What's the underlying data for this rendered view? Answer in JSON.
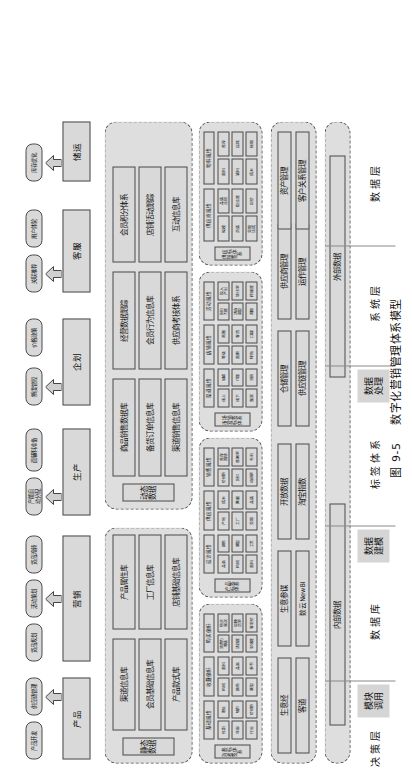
{
  "figure": {
    "caption_number": "图 9-5",
    "caption_title": "数字化营销管理体系模型"
  },
  "layers": [
    {
      "name": "决策层",
      "sub": "模块\n调用"
    },
    {
      "name": "数据库",
      "sub": "数据\n建模"
    },
    {
      "name": "标签体系",
      "sub": "数据\n处理"
    },
    {
      "name": "系统层",
      "sub": ""
    },
    {
      "name": "数据层",
      "sub": ""
    }
  ],
  "decision_layer": {
    "functions": [
      {
        "label": "产品",
        "chips": [
          "产品开发",
          "供应链管理"
        ]
      },
      {
        "label": "营销",
        "chips": [
          "货品规划",
          "活动策划",
          "货品流转"
        ]
      },
      {
        "label": "生产",
        "chips": [
          "产能自\n动分配",
          "面辅料准备"
        ]
      },
      {
        "label": "企划",
        "chips": [
          "额度管控",
          "价格政策"
        ]
      },
      {
        "label": "客服",
        "chips": [
          "关联推荐",
          "用户体验"
        ]
      },
      {
        "label": "储运",
        "chips": [
          "库存优化"
        ]
      }
    ]
  },
  "database_layer": {
    "groups": [
      {
        "title": "静态数据",
        "columns": [
          [
            "渠道信息库",
            "会员基础信息库",
            "产品款式库"
          ],
          [
            "产品属性库",
            "工厂信息库",
            "店铺基础信息库"
          ]
        ]
      },
      {
        "title": "动态数据",
        "columns": [
          [
            "商品销售数据库",
            "备货订单信息库",
            "渠道销售信息库"
          ],
          [
            "经营数据跟踪",
            "会员行为信息库",
            "供应商考核体系"
          ],
          [
            "会员积分体系",
            "店铺活动跟踪",
            "互动信息库"
          ]
        ]
      }
    ]
  },
  "tag_layer": {
    "groups": [
      {
        "title": "消费者标签体系",
        "subgroups": [
          "基础属性",
          "收藏偏好",
          "购买偏好"
        ],
        "tiles": [
          [
            "性别",
            "年龄",
            "行业",
            "职业",
            "城市",
            "价格带"
          ],
          [
            "风格",
            "颜色",
            "版型",
            "面料",
            "品类",
            "季节"
          ],
          [
            "消费力\n等级",
            "活跃度",
            "忠诚度",
            "购买\n频次",
            "退换\n货率",
            "客单价"
          ]
        ]
      },
      {
        "title": "产品标签体系",
        "subgroups": [
          "设计属性",
          "供应属性",
          "销售属性"
        ],
        "tiles": [
          [
            "品类",
            "风格",
            "面料",
            "颜色",
            "版型",
            "工艺"
          ],
          [
            "产地",
            "工厂",
            "交期",
            "成本",
            "批量",
            "品质"
          ],
          [
            "价格带",
            "折扣",
            "动销率",
            "库存\n周转",
            "售罄率",
            "毛利"
          ]
        ]
      },
      {
        "title": "市场营销标签体系",
        "subgroups": [
          "渠道属性",
          "店铺属性",
          "活动属性"
        ],
        "tiles": [
          [
            "线上",
            "线下",
            "直营",
            "加盟",
            "代理",
            "分销"
          ],
          [
            "等级",
            "面积",
            "坪效",
            "商圈",
            "客流",
            "口碑"
          ],
          [
            "折扣\n力度",
            "活动\n类型",
            "周期",
            "投入\n产出",
            "转化率",
            "传播度"
          ]
        ]
      },
      {
        "title": "供应链标签体系",
        "subgroups": [
          "供应商属性",
          "物料属性"
        ],
        "tiles": [
          [
            "规模",
            "资质",
            "交期\n达成",
            "品质\n合格",
            "配合度",
            "报价"
          ],
          [
            "面料",
            "辅料",
            "成本",
            "库存",
            "损耗",
            "账期"
          ]
        ]
      }
    ]
  },
  "system_layer": {
    "systems": [
      [
        "生意经",
        "客道"
      ],
      [
        "生意参谋",
        "数云NewBI"
      ],
      [
        "开放数据",
        "淘宝指数"
      ],
      [
        "仓储管理",
        "供应链管理"
      ],
      [
        "供应商管理",
        "运作管理"
      ],
      [
        "资产管理",
        "客户关系管理"
      ]
    ]
  },
  "data_layer": {
    "sources": [
      "内部数据",
      "外部数据"
    ]
  },
  "colors": {
    "box_fill": "#d9d9d9",
    "group_fill": "#dedede",
    "border": "#4a4a4a",
    "label_shade": "#d5d5d5"
  }
}
